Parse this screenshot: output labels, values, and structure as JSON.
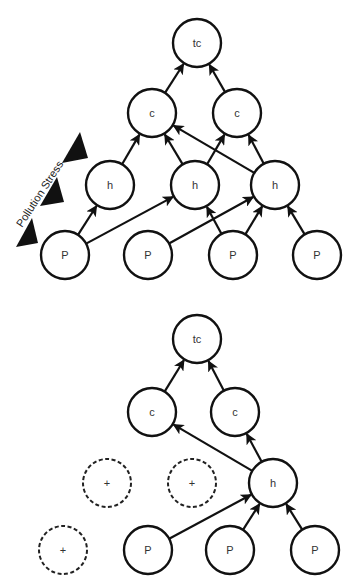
{
  "stress": {
    "label": "Pollution Stress",
    "markers": 3
  },
  "diagrams": [
    {
      "name": "before",
      "nodes": [
        {
          "id": "tc",
          "label": "tc",
          "type": "solid"
        },
        {
          "id": "c1",
          "label": "c",
          "type": "solid"
        },
        {
          "id": "c2",
          "label": "c",
          "type": "solid"
        },
        {
          "id": "h1",
          "label": "h",
          "type": "solid"
        },
        {
          "id": "h2",
          "label": "h",
          "type": "solid"
        },
        {
          "id": "h3",
          "label": "h",
          "type": "solid"
        },
        {
          "id": "p1",
          "label": "P",
          "type": "solid"
        },
        {
          "id": "p2",
          "label": "P",
          "type": "solid"
        },
        {
          "id": "p3",
          "label": "P",
          "type": "solid"
        },
        {
          "id": "p4",
          "label": "P",
          "type": "solid"
        }
      ],
      "edges": [
        [
          "c1",
          "tc"
        ],
        [
          "c2",
          "tc"
        ],
        [
          "h1",
          "c1"
        ],
        [
          "h2",
          "c1"
        ],
        [
          "h2",
          "c2"
        ],
        [
          "h3",
          "c1"
        ],
        [
          "h3",
          "c2"
        ],
        [
          "p1",
          "h1"
        ],
        [
          "p1",
          "h2"
        ],
        [
          "p2",
          "h3"
        ],
        [
          "p3",
          "h2"
        ],
        [
          "p3",
          "h3"
        ],
        [
          "p4",
          "h3"
        ]
      ]
    },
    {
      "name": "after",
      "nodes": [
        {
          "id": "tc",
          "label": "tc",
          "type": "solid"
        },
        {
          "id": "c1",
          "label": "c",
          "type": "solid"
        },
        {
          "id": "c2",
          "label": "c",
          "type": "solid"
        },
        {
          "id": "x1",
          "label": "+",
          "type": "dashed"
        },
        {
          "id": "x2",
          "label": "+",
          "type": "dashed"
        },
        {
          "id": "h3",
          "label": "h",
          "type": "solid"
        },
        {
          "id": "x3",
          "label": "+",
          "type": "dashed"
        },
        {
          "id": "p2",
          "label": "P",
          "type": "solid"
        },
        {
          "id": "p3",
          "label": "P",
          "type": "solid"
        },
        {
          "id": "p4",
          "label": "P",
          "type": "solid"
        }
      ],
      "edges": [
        [
          "c1",
          "tc"
        ],
        [
          "c2",
          "tc"
        ],
        [
          "h3",
          "c1"
        ],
        [
          "h3",
          "c2"
        ],
        [
          "p2",
          "h3"
        ],
        [
          "p3",
          "h3"
        ],
        [
          "p4",
          "h3"
        ]
      ]
    }
  ]
}
